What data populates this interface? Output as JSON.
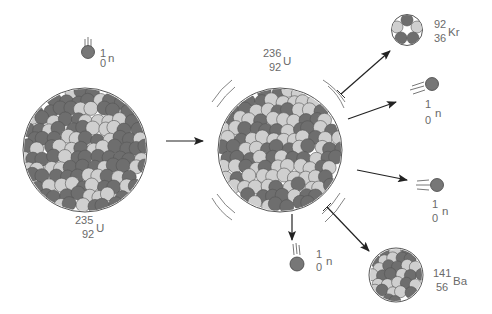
{
  "diagram": {
    "colors": {
      "proton": "#6e6e6e",
      "neutron_particle": "#cfcfcf",
      "outline": "#444444",
      "free_neutron": "#777777",
      "arrow": "#222222",
      "label": "#6a6a6a",
      "background": "#ffffff"
    },
    "incoming_neutron": {
      "mass": "1",
      "atomic": "0",
      "symbol": "n"
    },
    "target_nucleus": {
      "mass": "235",
      "atomic": "92",
      "symbol": "U"
    },
    "compound_nucleus": {
      "mass": "236",
      "atomic": "92",
      "symbol": "U"
    },
    "products": {
      "krypton": {
        "mass": "92",
        "atomic": "36",
        "symbol": "Kr"
      },
      "barium": {
        "mass": "141",
        "atomic": "56",
        "symbol": "Ba"
      },
      "neutrons": [
        {
          "mass": "1",
          "atomic": "0",
          "symbol": "n"
        },
        {
          "mass": "1",
          "atomic": "0",
          "symbol": "n"
        },
        {
          "mass": "1",
          "atomic": "0",
          "symbol": "n"
        }
      ]
    }
  }
}
